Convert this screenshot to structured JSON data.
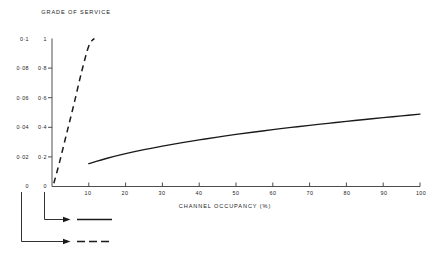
{
  "chart_data": {
    "type": "line",
    "title": "GRADE OF SERVICE",
    "xlabel": "CHANNEL OCCUPANCY (%)",
    "ylabel": "GRADE OF SERVICE",
    "grid": false,
    "legend_position": "bottom-left",
    "xlim": [
      0,
      100
    ],
    "x_ticks": [
      10,
      20,
      30,
      40,
      50,
      60,
      70,
      80,
      90,
      100
    ],
    "x_tick_labels": [
      "10",
      "20",
      "30",
      "40",
      "50",
      "60",
      "70",
      "80",
      "90",
      "100"
    ],
    "axes": [
      {
        "name": "inner-axis",
        "position": "left-inner",
        "ylim": [
          0,
          1
        ],
        "ticks": [
          0,
          0.2,
          0.4,
          0.6,
          0.8,
          1
        ],
        "tick_labels": [
          "0",
          "0·2",
          "0·4",
          "0·6",
          "0·8",
          "1"
        ],
        "series_style": "solid"
      },
      {
        "name": "outer-axis",
        "position": "left-outer",
        "ylim": [
          0,
          0.1
        ],
        "ticks": [
          0,
          0.02,
          0.04,
          0.06,
          0.08,
          0.1
        ],
        "tick_labels": [
          "0",
          "0·02",
          "0·04",
          "0·06",
          "0·08",
          "0·1"
        ],
        "series_style": "dashed"
      }
    ],
    "series": [
      {
        "name": "solid-curve",
        "style": "solid",
        "axis": "inner-axis",
        "x": [
          10,
          15,
          20,
          25,
          30,
          35,
          40,
          45,
          50,
          55,
          60,
          65,
          70,
          75,
          80,
          85,
          90,
          95,
          100
        ],
        "values": [
          0.155,
          0.191,
          0.222,
          0.249,
          0.273,
          0.295,
          0.315,
          0.334,
          0.352,
          0.368,
          0.384,
          0.399,
          0.413,
          0.427,
          0.44,
          0.453,
          0.465,
          0.477,
          0.489
        ]
      },
      {
        "name": "dashed-curve",
        "style": "dashed",
        "axis": "outer-axis",
        "x": [
          0.5,
          2,
          4,
          6,
          8,
          10,
          11.5
        ],
        "values": [
          0.0022,
          0.016,
          0.036,
          0.056,
          0.077,
          0.095,
          0.1
        ]
      }
    ]
  },
  "legend": {
    "items": [
      {
        "label": "",
        "style": "solid",
        "source_axis": "inner-axis"
      },
      {
        "label": "",
        "style": "dashed",
        "source_axis": "outer-axis"
      }
    ]
  },
  "colors": {
    "line": "#1a1a1a",
    "axis": "#3a3a3a",
    "text": "#1d1d1d",
    "background": "#ffffff"
  }
}
